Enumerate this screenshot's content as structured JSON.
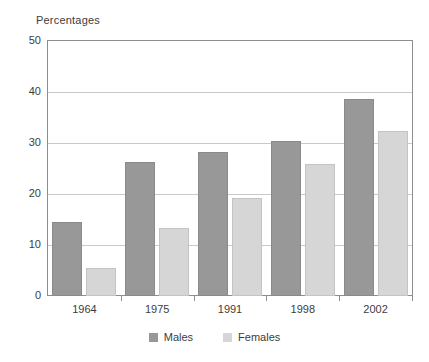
{
  "chart_data": {
    "type": "bar",
    "title": "Percentages",
    "xlabel": "",
    "ylabel": "",
    "categories": [
      "1964",
      "1975",
      "1991",
      "1998",
      "2002"
    ],
    "series": [
      {
        "name": "Males",
        "color": "#989898",
        "values": [
          14.5,
          26.3,
          28.3,
          30.3,
          38.6
        ]
      },
      {
        "name": "Females",
        "color": "#d6d6d6",
        "values": [
          5.5,
          13.4,
          19.3,
          25.8,
          32.4
        ]
      }
    ],
    "ylim": [
      0,
      50
    ],
    "yticks": [
      0,
      10,
      20,
      30,
      40,
      50
    ],
    "ytick_labels": [
      "0",
      "10",
      "20",
      "30",
      "40",
      "50"
    ],
    "grid": true,
    "grid_axis": "y",
    "legend_position": "bottom-center"
  },
  "legend": {
    "items": [
      {
        "label": "Males"
      },
      {
        "label": "Females"
      }
    ]
  }
}
